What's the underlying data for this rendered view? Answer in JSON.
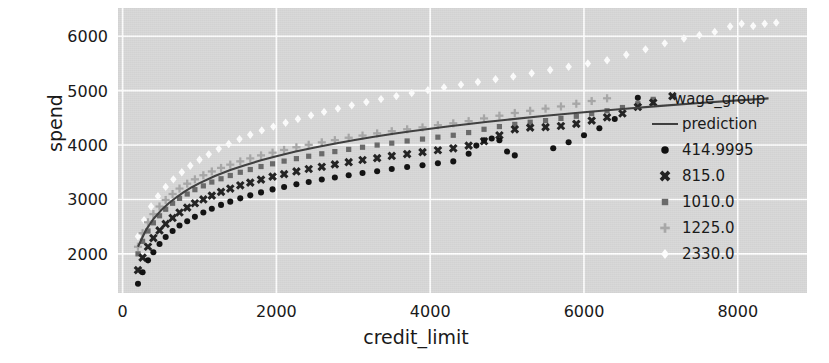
{
  "chart_data": {
    "type": "scatter",
    "title": "",
    "xlabel": "credit_limit",
    "ylabel": "spend",
    "xlim": [
      -60,
      8900
    ],
    "ylim": [
      1280,
      6520
    ],
    "xticks": [
      0,
      2000,
      4000,
      6000,
      8000
    ],
    "yticks": [
      2000,
      3000,
      4000,
      5000,
      6000
    ],
    "xtick_labels": [
      "0",
      "2000",
      "4000",
      "6000",
      "8000"
    ],
    "ytick_labels": [
      "2000",
      "3000",
      "4000",
      "5000",
      "6000"
    ],
    "grid": true,
    "grid_color": "#ffffff",
    "plot_bg": "#d9d9d9",
    "legend_position": "right",
    "legend_title": "wage_group",
    "series": [
      {
        "name": "prediction",
        "kind": "line",
        "marker": "line",
        "color": "#3f3f3f",
        "points": [
          [
            200,
            2130
          ],
          [
            300,
            2430
          ],
          [
            400,
            2640
          ],
          [
            500,
            2800
          ],
          [
            600,
            2930
          ],
          [
            700,
            3040
          ],
          [
            800,
            3140
          ],
          [
            900,
            3225
          ],
          [
            1000,
            3300
          ],
          [
            1200,
            3430
          ],
          [
            1400,
            3540
          ],
          [
            1600,
            3635
          ],
          [
            1800,
            3720
          ],
          [
            2000,
            3795
          ],
          [
            2250,
            3880
          ],
          [
            2500,
            3955
          ],
          [
            2750,
            4025
          ],
          [
            3000,
            4090
          ],
          [
            3250,
            4148
          ],
          [
            3500,
            4203
          ],
          [
            3750,
            4253
          ],
          [
            4000,
            4300
          ],
          [
            4250,
            4345
          ],
          [
            4500,
            4388
          ],
          [
            4750,
            4428
          ],
          [
            5000,
            4466
          ],
          [
            5500,
            4538
          ],
          [
            6000,
            4604
          ],
          [
            6500,
            4664
          ],
          [
            7000,
            4720
          ],
          [
            7500,
            4772
          ],
          [
            8000,
            4821
          ],
          [
            8400,
            4858
          ]
        ]
      },
      {
        "name": "414.9995",
        "kind": "scatter",
        "marker": "circle",
        "color": "#111111",
        "points": [
          [
            200,
            1450
          ],
          [
            260,
            1660
          ],
          [
            330,
            1880
          ],
          [
            400,
            2030
          ],
          [
            480,
            2180
          ],
          [
            560,
            2310
          ],
          [
            650,
            2420
          ],
          [
            740,
            2520
          ],
          [
            840,
            2600
          ],
          [
            940,
            2680
          ],
          [
            1050,
            2760
          ],
          [
            1160,
            2830
          ],
          [
            1280,
            2900
          ],
          [
            1400,
            2960
          ],
          [
            1530,
            3020
          ],
          [
            1660,
            3075
          ],
          [
            1800,
            3130
          ],
          [
            1950,
            3185
          ],
          [
            2100,
            3230
          ],
          [
            2260,
            3280
          ],
          [
            2420,
            3320
          ],
          [
            2590,
            3365
          ],
          [
            2760,
            3405
          ],
          [
            2940,
            3445
          ],
          [
            3120,
            3485
          ],
          [
            3310,
            3520
          ],
          [
            3500,
            3560
          ],
          [
            3700,
            3595
          ],
          [
            3900,
            3630
          ],
          [
            4100,
            3665
          ],
          [
            4300,
            3700
          ],
          [
            4500,
            3840
          ],
          [
            4600,
            3990
          ],
          [
            4700,
            4090
          ],
          [
            4800,
            4120
          ],
          [
            4900,
            4090
          ],
          [
            5000,
            3880
          ],
          [
            5100,
            3810
          ],
          [
            5600,
            3940
          ],
          [
            5800,
            4050
          ],
          [
            6000,
            4180
          ],
          [
            6200,
            4310
          ],
          [
            6400,
            4480
          ],
          [
            6700,
            4870
          ]
        ]
      },
      {
        "name": "815.0",
        "kind": "scatter",
        "marker": "x",
        "color": "#222222",
        "points": [
          [
            200,
            1700
          ],
          [
            260,
            1930
          ],
          [
            330,
            2130
          ],
          [
            400,
            2290
          ],
          [
            480,
            2430
          ],
          [
            560,
            2550
          ],
          [
            650,
            2660
          ],
          [
            740,
            2760
          ],
          [
            840,
            2850
          ],
          [
            940,
            2930
          ],
          [
            1050,
            3000
          ],
          [
            1160,
            3070
          ],
          [
            1280,
            3140
          ],
          [
            1400,
            3200
          ],
          [
            1530,
            3260
          ],
          [
            1660,
            3310
          ],
          [
            1800,
            3365
          ],
          [
            1950,
            3420
          ],
          [
            2100,
            3465
          ],
          [
            2260,
            3515
          ],
          [
            2420,
            3560
          ],
          [
            2590,
            3600
          ],
          [
            2760,
            3645
          ],
          [
            2940,
            3685
          ],
          [
            3120,
            3725
          ],
          [
            3310,
            3760
          ],
          [
            3500,
            3800
          ],
          [
            3700,
            3835
          ],
          [
            3900,
            3870
          ],
          [
            4100,
            3905
          ],
          [
            4300,
            3940
          ],
          [
            4500,
            3990
          ],
          [
            4700,
            4070
          ],
          [
            4900,
            4180
          ],
          [
            5100,
            4290
          ],
          [
            5300,
            4320
          ],
          [
            5500,
            4330
          ],
          [
            5700,
            4350
          ],
          [
            5900,
            4390
          ],
          [
            6100,
            4450
          ],
          [
            6300,
            4510
          ],
          [
            6500,
            4580
          ],
          [
            6700,
            4700
          ],
          [
            6900,
            4780
          ],
          [
            7150,
            4900
          ]
        ]
      },
      {
        "name": "1010.0",
        "kind": "scatter",
        "marker": "square",
        "color": "#6a6a6a",
        "points": [
          [
            200,
            2000
          ],
          [
            260,
            2230
          ],
          [
            330,
            2420
          ],
          [
            400,
            2570
          ],
          [
            480,
            2700
          ],
          [
            560,
            2820
          ],
          [
            650,
            2930
          ],
          [
            740,
            3020
          ],
          [
            840,
            3100
          ],
          [
            940,
            3180
          ],
          [
            1050,
            3250
          ],
          [
            1160,
            3320
          ],
          [
            1280,
            3380
          ],
          [
            1400,
            3440
          ],
          [
            1530,
            3500
          ],
          [
            1660,
            3550
          ],
          [
            1800,
            3605
          ],
          [
            1950,
            3655
          ],
          [
            2100,
            3705
          ],
          [
            2260,
            3750
          ],
          [
            2420,
            3795
          ],
          [
            2590,
            3840
          ],
          [
            2760,
            3880
          ],
          [
            2940,
            3920
          ],
          [
            3120,
            3960
          ],
          [
            3310,
            4000
          ],
          [
            3500,
            4035
          ],
          [
            3700,
            4075
          ],
          [
            3900,
            4110
          ],
          [
            4100,
            4145
          ],
          [
            4300,
            4180
          ],
          [
            4500,
            4230
          ],
          [
            4700,
            4290
          ],
          [
            4900,
            4340
          ],
          [
            5100,
            4380
          ],
          [
            5300,
            4420
          ],
          [
            5500,
            4450
          ],
          [
            5700,
            4490
          ],
          [
            5900,
            4530
          ],
          [
            6100,
            4580
          ],
          [
            6300,
            4630
          ],
          [
            6500,
            4690
          ],
          [
            6700,
            4760
          ],
          [
            6900,
            4840
          ]
        ]
      },
      {
        "name": "1225.0",
        "kind": "scatter",
        "marker": "plus",
        "color": "#a8a8a8",
        "points": [
          [
            200,
            2130
          ],
          [
            260,
            2380
          ],
          [
            330,
            2580
          ],
          [
            400,
            2730
          ],
          [
            480,
            2870
          ],
          [
            560,
            2990
          ],
          [
            650,
            3100
          ],
          [
            740,
            3200
          ],
          [
            840,
            3290
          ],
          [
            940,
            3370
          ],
          [
            1050,
            3445
          ],
          [
            1160,
            3515
          ],
          [
            1280,
            3580
          ],
          [
            1400,
            3640
          ],
          [
            1530,
            3700
          ],
          [
            1660,
            3755
          ],
          [
            1800,
            3810
          ],
          [
            1950,
            3860
          ],
          [
            2100,
            3910
          ],
          [
            2260,
            3960
          ],
          [
            2420,
            4005
          ],
          [
            2590,
            4050
          ],
          [
            2760,
            4090
          ],
          [
            2940,
            4135
          ],
          [
            3120,
            4175
          ],
          [
            3310,
            4215
          ],
          [
            3500,
            4255
          ],
          [
            3700,
            4290
          ],
          [
            3900,
            4325
          ],
          [
            4100,
            4365
          ],
          [
            4300,
            4400
          ],
          [
            4500,
            4440
          ],
          [
            4700,
            4490
          ],
          [
            4900,
            4540
          ],
          [
            5100,
            4590
          ],
          [
            5300,
            4630
          ],
          [
            5500,
            4670
          ],
          [
            5700,
            4710
          ],
          [
            5900,
            4760
          ],
          [
            6100,
            4810
          ],
          [
            6300,
            4860
          ]
        ]
      },
      {
        "name": "2330.0",
        "kind": "scatter",
        "marker": "diamond",
        "color": "#fdfdfd",
        "points": [
          [
            200,
            2320
          ],
          [
            280,
            2620
          ],
          [
            370,
            2870
          ],
          [
            460,
            3060
          ],
          [
            560,
            3230
          ],
          [
            660,
            3370
          ],
          [
            770,
            3500
          ],
          [
            880,
            3620
          ],
          [
            1000,
            3730
          ],
          [
            1120,
            3830
          ],
          [
            1250,
            3930
          ],
          [
            1380,
            4020
          ],
          [
            1520,
            4110
          ],
          [
            1660,
            4190
          ],
          [
            1810,
            4270
          ],
          [
            1960,
            4340
          ],
          [
            2120,
            4410
          ],
          [
            2280,
            4480
          ],
          [
            2450,
            4545
          ],
          [
            2620,
            4610
          ],
          [
            2800,
            4670
          ],
          [
            2980,
            4730
          ],
          [
            3170,
            4790
          ],
          [
            3360,
            4845
          ],
          [
            3560,
            4900
          ],
          [
            3760,
            4955
          ],
          [
            3970,
            5010
          ],
          [
            4180,
            5060
          ],
          [
            4400,
            5110
          ],
          [
            4620,
            5160
          ],
          [
            4850,
            5210
          ],
          [
            5080,
            5260
          ],
          [
            5320,
            5320
          ],
          [
            5560,
            5380
          ],
          [
            5800,
            5440
          ],
          [
            6050,
            5500
          ],
          [
            6300,
            5560
          ],
          [
            6550,
            5660
          ],
          [
            6800,
            5760
          ],
          [
            7050,
            5870
          ],
          [
            7300,
            5960
          ],
          [
            7500,
            6020
          ],
          [
            7700,
            6080
          ],
          [
            7900,
            6180
          ],
          [
            8050,
            6230
          ],
          [
            8200,
            6190
          ],
          [
            8350,
            6230
          ],
          [
            8500,
            6250
          ]
        ]
      }
    ]
  },
  "legend": {
    "title": "wage_group",
    "entries": [
      {
        "label": "prediction",
        "marker": "line",
        "color": "#3f3f3f"
      },
      {
        "label": "414.9995",
        "marker": "circle",
        "color": "#111111"
      },
      {
        "label": "815.0",
        "marker": "x",
        "color": "#222222"
      },
      {
        "label": "1010.0",
        "marker": "square",
        "color": "#6a6a6a"
      },
      {
        "label": "1225.0",
        "marker": "plus",
        "color": "#a8a8a8"
      },
      {
        "label": "2330.0",
        "marker": "diamond",
        "color": "#fdfdfd"
      }
    ]
  }
}
